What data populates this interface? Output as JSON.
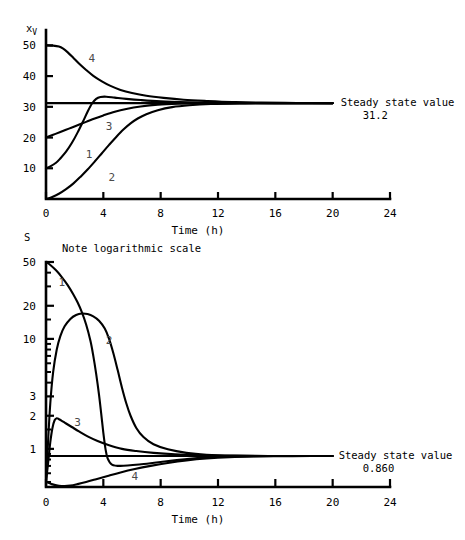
{
  "figure": {
    "title": "",
    "background": "#ffffff",
    "ink_color": "#000000",
    "label_color": "#4a4a4a"
  },
  "chart_data": [
    {
      "id": "viable-biomass-chart",
      "type": "line",
      "title": "",
      "ylabel": "x",
      "ylabel_subscript": "V",
      "xlabel": "Time (h)",
      "scale": "linear",
      "xlim": [
        0,
        24
      ],
      "ylim": [
        0,
        55
      ],
      "xticks": [
        0,
        4,
        8,
        12,
        16,
        20,
        24
      ],
      "xtick_labels": [
        "0",
        "4",
        "8",
        "12",
        "16",
        "20",
        "24"
      ],
      "yticks": [
        10,
        20,
        30,
        40,
        50
      ],
      "ytick_labels": [
        "10",
        "20",
        "30",
        "40",
        "50"
      ],
      "grid": false,
      "legend": "inline-curve-numbers",
      "steady_state": {
        "value": 31.2,
        "label_line1": "Steady state value",
        "label_line2": "31.2",
        "line_from_x": 0,
        "line_to_x": 20
      },
      "series": [
        {
          "name": "1",
          "label": "1",
          "initial_value": 10,
          "label_x": 3.0,
          "label_y": 13.5,
          "points": [
            [
              0.0,
              10.0
            ],
            [
              0.3,
              10.6
            ],
            [
              0.7,
              11.8
            ],
            [
              1.0,
              13.2
            ],
            [
              1.4,
              15.4
            ],
            [
              1.8,
              18.2
            ],
            [
              2.2,
              21.6
            ],
            [
              2.6,
              25.4
            ],
            [
              2.9,
              28.4
            ],
            [
              3.2,
              31.0
            ],
            [
              3.5,
              32.6
            ],
            [
              3.8,
              33.2
            ],
            [
              4.2,
              33.3
            ],
            [
              4.8,
              33.0
            ],
            [
              5.6,
              32.6
            ],
            [
              6.6,
              32.2
            ],
            [
              8.0,
              31.8
            ],
            [
              10.0,
              31.5
            ],
            [
              12.0,
              31.3
            ],
            [
              14.0,
              31.25
            ],
            [
              17.0,
              31.2
            ],
            [
              20.0,
              31.2
            ]
          ]
        },
        {
          "name": "2",
          "label": "2",
          "initial_value": 0,
          "label_x": 4.6,
          "label_y": 6.0,
          "points": [
            [
              0.0,
              0.0
            ],
            [
              0.4,
              0.6
            ],
            [
              0.9,
              1.7
            ],
            [
              1.4,
              3.2
            ],
            [
              1.9,
              5.0
            ],
            [
              2.4,
              7.2
            ],
            [
              2.9,
              9.6
            ],
            [
              3.4,
              12.2
            ],
            [
              3.9,
              14.9
            ],
            [
              4.4,
              17.6
            ],
            [
              4.9,
              20.2
            ],
            [
              5.4,
              22.6
            ],
            [
              5.9,
              24.6
            ],
            [
              6.4,
              26.2
            ],
            [
              7.0,
              27.6
            ],
            [
              7.8,
              28.9
            ],
            [
              8.8,
              29.9
            ],
            [
              10.0,
              30.5
            ],
            [
              11.5,
              30.9
            ],
            [
              13.5,
              31.1
            ],
            [
              16.0,
              31.2
            ],
            [
              20.0,
              31.2
            ]
          ]
        },
        {
          "name": "3",
          "label": "3",
          "initial_value": 20,
          "label_x": 4.4,
          "label_y": 22.5,
          "points": [
            [
              0.0,
              20.0
            ],
            [
              0.5,
              20.9
            ],
            [
              1.0,
              21.8
            ],
            [
              1.6,
              22.9
            ],
            [
              2.2,
              24.0
            ],
            [
              2.8,
              25.1
            ],
            [
              3.4,
              26.2
            ],
            [
              4.0,
              27.2
            ],
            [
              4.8,
              28.4
            ],
            [
              5.6,
              29.3
            ],
            [
              6.6,
              30.1
            ],
            [
              7.8,
              30.7
            ],
            [
              9.2,
              31.0
            ],
            [
              11.0,
              31.15
            ],
            [
              13.0,
              31.2
            ],
            [
              16.0,
              31.2
            ],
            [
              20.0,
              31.2
            ]
          ]
        },
        {
          "name": "4",
          "label": "4",
          "initial_value": 50,
          "label_x": 3.2,
          "label_y": 44.5,
          "points": [
            [
              0.0,
              50.0
            ],
            [
              0.5,
              49.9
            ],
            [
              0.9,
              49.6
            ],
            [
              1.2,
              48.9
            ],
            [
              1.5,
              47.8
            ],
            [
              1.9,
              46.0
            ],
            [
              2.3,
              44.1
            ],
            [
              2.8,
              42.0
            ],
            [
              3.3,
              40.1
            ],
            [
              3.9,
              38.3
            ],
            [
              4.5,
              36.8
            ],
            [
              5.2,
              35.5
            ],
            [
              6.0,
              34.5
            ],
            [
              7.0,
              33.6
            ],
            [
              8.2,
              32.9
            ],
            [
              9.6,
              32.3
            ],
            [
              11.2,
              31.9
            ],
            [
              13.0,
              31.55
            ],
            [
              15.0,
              31.35
            ],
            [
              17.5,
              31.25
            ],
            [
              20.0,
              31.2
            ]
          ]
        }
      ]
    },
    {
      "id": "substrate-chart",
      "type": "line",
      "title": "",
      "ylabel": "S",
      "xlabel": "Time (h)",
      "scale": "logarithmic",
      "note": "Note logarithmic scale",
      "xlim": [
        0,
        24
      ],
      "ylim": [
        0.45,
        50
      ],
      "xticks": [
        0,
        4,
        8,
        12,
        16,
        20,
        24
      ],
      "xtick_labels": [
        "0",
        "4",
        "8",
        "12",
        "16",
        "20",
        "24"
      ],
      "yticks": [
        1,
        2,
        3,
        10,
        20,
        50
      ],
      "ytick_labels": [
        "1",
        "2",
        "3",
        "10",
        "20",
        "50"
      ],
      "yticks_minor": [
        0.5,
        0.6,
        0.7,
        0.8,
        0.9,
        1.5,
        4,
        5,
        6,
        7,
        8,
        9,
        15,
        30,
        40
      ],
      "grid": false,
      "legend": "inline-curve-numbers",
      "steady_state": {
        "value": 0.86,
        "label_line1": "Steady state value",
        "label_line2": "0.860",
        "line_from_x": 0,
        "line_to_x": 20
      },
      "series": [
        {
          "name": "1",
          "label": "1",
          "initial_value": 50,
          "label_x": 1.1,
          "label_y": 30.0,
          "points": [
            [
              0.0,
              50.0
            ],
            [
              0.3,
              47.0
            ],
            [
              0.7,
              42.0
            ],
            [
              1.1,
              36.5
            ],
            [
              1.5,
              31.0
            ],
            [
              1.9,
              25.5
            ],
            [
              2.2,
              21.5
            ],
            [
              2.5,
              17.5
            ],
            [
              2.8,
              13.5
            ],
            [
              3.1,
              9.6
            ],
            [
              3.3,
              7.0
            ],
            [
              3.5,
              4.8
            ],
            [
              3.7,
              3.1
            ],
            [
              3.85,
              2.1
            ],
            [
              4.0,
              1.4
            ],
            [
              4.15,
              1.0
            ],
            [
              4.3,
              0.82
            ],
            [
              4.6,
              0.72
            ],
            [
              5.2,
              0.7
            ],
            [
              6.5,
              0.72
            ],
            [
              8.0,
              0.76
            ],
            [
              10.0,
              0.81
            ],
            [
              12.0,
              0.845
            ],
            [
              14.0,
              0.858
            ],
            [
              17.0,
              0.86
            ],
            [
              20.0,
              0.86
            ]
          ]
        },
        {
          "name": "2",
          "label": "2",
          "initial_value": 0.5,
          "label_x": 4.4,
          "label_y": 9.0,
          "points": [
            [
              0.0,
              0.5
            ],
            [
              0.15,
              1.2
            ],
            [
              0.3,
              2.6
            ],
            [
              0.5,
              5.0
            ],
            [
              0.75,
              8.0
            ],
            [
              1.0,
              10.6
            ],
            [
              1.3,
              13.0
            ],
            [
              1.7,
              15.2
            ],
            [
              2.1,
              16.5
            ],
            [
              2.5,
              17.0
            ],
            [
              2.9,
              16.8
            ],
            [
              3.3,
              16.0
            ],
            [
              3.7,
              14.6
            ],
            [
              4.1,
              12.4
            ],
            [
              4.4,
              10.0
            ],
            [
              4.7,
              7.4
            ],
            [
              5.0,
              5.2
            ],
            [
              5.3,
              3.6
            ],
            [
              5.6,
              2.6
            ],
            [
              5.9,
              2.0
            ],
            [
              6.3,
              1.55
            ],
            [
              6.8,
              1.28
            ],
            [
              7.5,
              1.1
            ],
            [
              8.5,
              0.99
            ],
            [
              9.8,
              0.92
            ],
            [
              11.2,
              0.885
            ],
            [
              13.0,
              0.868
            ],
            [
              15.5,
              0.861
            ],
            [
              18.0,
              0.86
            ],
            [
              20.0,
              0.86
            ]
          ]
        },
        {
          "name": "3",
          "label": "3",
          "initial_value": 0.5,
          "label_x": 2.2,
          "label_y": 1.62,
          "points": [
            [
              0.0,
              0.5
            ],
            [
              0.15,
              0.75
            ],
            [
              0.3,
              1.15
            ],
            [
              0.45,
              1.55
            ],
            [
              0.6,
              1.82
            ],
            [
              0.75,
              1.9
            ],
            [
              0.9,
              1.86
            ],
            [
              1.1,
              1.8
            ],
            [
              1.4,
              1.7
            ],
            [
              1.8,
              1.58
            ],
            [
              2.3,
              1.44
            ],
            [
              2.9,
              1.3
            ],
            [
              3.6,
              1.18
            ],
            [
              4.4,
              1.08
            ],
            [
              5.3,
              1.0
            ],
            [
              6.3,
              0.955
            ],
            [
              7.5,
              0.92
            ],
            [
              9.0,
              0.893
            ],
            [
              10.8,
              0.876
            ],
            [
              12.8,
              0.866
            ],
            [
              15.0,
              0.861
            ],
            [
              18.0,
              0.86
            ],
            [
              20.0,
              0.86
            ]
          ]
        },
        {
          "name": "4",
          "label": "4",
          "initial_value": 0.5,
          "label_x": 6.2,
          "label_y": 0.52,
          "points": [
            [
              0.0,
              0.5
            ],
            [
              0.4,
              0.478
            ],
            [
              0.9,
              0.462
            ],
            [
              1.3,
              0.458
            ],
            [
              1.7,
              0.463
            ],
            [
              2.2,
              0.478
            ],
            [
              2.8,
              0.5
            ],
            [
              3.5,
              0.53
            ],
            [
              4.3,
              0.567
            ],
            [
              5.2,
              0.61
            ],
            [
              6.2,
              0.655
            ],
            [
              7.3,
              0.7
            ],
            [
              8.5,
              0.745
            ],
            [
              9.8,
              0.786
            ],
            [
              11.2,
              0.818
            ],
            [
              12.8,
              0.841
            ],
            [
              14.5,
              0.853
            ],
            [
              16.5,
              0.858
            ],
            [
              18.5,
              0.86
            ],
            [
              20.0,
              0.86
            ]
          ]
        }
      ]
    }
  ]
}
